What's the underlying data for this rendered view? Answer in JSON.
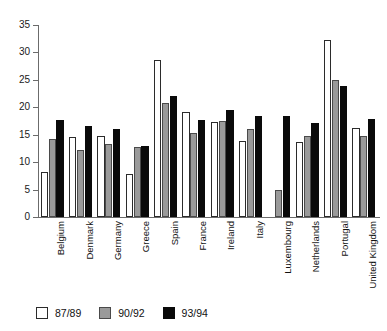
{
  "chart_data": {
    "type": "bar",
    "title": "",
    "subtitle": "",
    "xlabel": "",
    "ylabel": "",
    "ylim": [
      0,
      35
    ],
    "ytick_step": 5,
    "yticks": [
      0,
      5,
      10,
      15,
      20,
      25,
      30,
      35
    ],
    "ytick_labels": [
      "0",
      "5",
      "10",
      "15",
      "20",
      "25",
      "30",
      "35"
    ],
    "grid": false,
    "legend_position": "bottom-left",
    "orientation": "vertical",
    "categories": [
      "Belgium",
      "Denmark",
      "Germany",
      "Greece",
      "Spain",
      "France",
      "Ireland",
      "Italy",
      "Luxembourg",
      "Netherlands",
      "Portugal",
      "United Kingdom"
    ],
    "series": [
      {
        "name": "87/89",
        "color": "#ffffff",
        "edge_color": "#2b2b2b",
        "values": [
          8.2,
          14.6,
          14.7,
          7.8,
          28.7,
          19.2,
          17.3,
          13.8,
          null,
          13.7,
          32.3,
          16.3
        ]
      },
      {
        "name": "90/92",
        "color": "#9a9a9a",
        "edge_color": "#4a4a4a",
        "values": [
          14.3,
          12.2,
          13.3,
          12.7,
          20.7,
          15.4,
          17.5,
          16.1,
          5.0,
          14.8,
          25.0,
          14.7
        ]
      },
      {
        "name": "93/94",
        "color": "#0a0a0a",
        "edge_color": "#0a0a0a",
        "values": [
          17.6,
          16.6,
          16.0,
          13.0,
          22.0,
          17.6,
          19.5,
          18.5,
          18.5,
          17.1,
          23.9,
          17.8
        ]
      }
    ]
  },
  "legend": {
    "items": [
      {
        "label": "87/89",
        "swatch": "white-swatch"
      },
      {
        "label": "90/92",
        "swatch": "gray-swatch"
      },
      {
        "label": "93/94",
        "swatch": "black-swatch"
      }
    ]
  }
}
